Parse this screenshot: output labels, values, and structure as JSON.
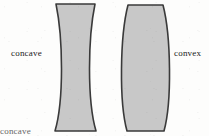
{
  "figure": {
    "background_color": "#fdfdfc",
    "lens_fill_color": "#c8c8c8",
    "lens_outline_color": "#3a3a3a",
    "text_color": "#1a1a1a"
  },
  "labels": {
    "left": "concave",
    "right": "convex",
    "bottom_clipped": "concave"
  },
  "shapes": [
    {
      "name": "biconcave-lens",
      "type": "biconcave",
      "label": "concave",
      "top_left_x": 56,
      "top_right_x": 95,
      "bottom_left_x": 55,
      "bottom_right_x": 96,
      "top_y": 4,
      "bottom_y": 131,
      "waist_left_x": 64,
      "waist_right_x": 87,
      "waist_y": 68
    },
    {
      "name": "biconvex-lens",
      "type": "biconvex",
      "label": "convex",
      "top_left_x": 128,
      "top_right_x": 163,
      "bottom_left_x": 127,
      "bottom_right_x": 164,
      "top_y": 5,
      "bottom_y": 131,
      "widest_left_x": 117,
      "widest_right_x": 173,
      "widest_y": 68
    }
  ]
}
